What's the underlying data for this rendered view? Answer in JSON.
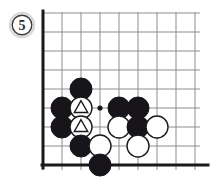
{
  "diagram": {
    "kind": "go-board-diagram",
    "figure_label": "5",
    "label_shape": "circle",
    "colors": {
      "background": "#ffffff",
      "grid_line": "#8d8d8d",
      "board_edge": "#1a1a1a",
      "black_stone": "#17151a",
      "white_stone_fill": "#ffffff",
      "white_stone_edge": "#1a1a1a",
      "marker": "#1a1a1a",
      "label_text": "#2b2b2b"
    },
    "board": {
      "origin_x": 43,
      "origin_y": 13,
      "spacing": 19,
      "cols": 9,
      "rows": 9,
      "left_edge_thick": true,
      "bottom_edge_thick": true,
      "star_points": [
        {
          "col": 3,
          "row": 5
        }
      ],
      "corner": "bottom-left"
    },
    "stone_radius": 11,
    "stones": [
      {
        "col": 2,
        "row": 4,
        "color": "black",
        "marker": "none"
      },
      {
        "col": 1,
        "row": 5,
        "color": "black",
        "marker": "none"
      },
      {
        "col": 2,
        "row": 5,
        "color": "white",
        "marker": "triangle"
      },
      {
        "col": 4,
        "row": 5,
        "color": "black",
        "marker": "none"
      },
      {
        "col": 5,
        "row": 5,
        "color": "black",
        "marker": "none"
      },
      {
        "col": 1,
        "row": 6,
        "color": "black",
        "marker": "none"
      },
      {
        "col": 2,
        "row": 6,
        "color": "white",
        "marker": "triangle"
      },
      {
        "col": 4,
        "row": 6,
        "color": "white",
        "marker": "none"
      },
      {
        "col": 5,
        "row": 6,
        "color": "black",
        "marker": "none"
      },
      {
        "col": 6,
        "row": 6,
        "color": "white",
        "marker": "none"
      },
      {
        "col": 2,
        "row": 7,
        "color": "black",
        "marker": "none"
      },
      {
        "col": 3,
        "row": 7,
        "color": "white",
        "marker": "none"
      },
      {
        "col": 5,
        "row": 7,
        "color": "white",
        "marker": "none"
      },
      {
        "col": 3,
        "row": 8,
        "color": "black",
        "marker": "none"
      }
    ],
    "label_badge": {
      "cx": 22,
      "cy": 25,
      "r": 12
    }
  }
}
